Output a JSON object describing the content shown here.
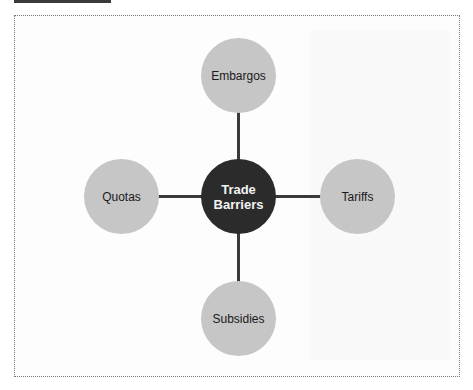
{
  "diagram": {
    "center": {
      "label_line1": "Trade",
      "label_line2": "Barriers"
    },
    "nodes": [
      {
        "position": "top",
        "label": "Embargos"
      },
      {
        "position": "right",
        "label": "Tariffs"
      },
      {
        "position": "bottom",
        "label": "Subsidies"
      },
      {
        "position": "left",
        "label": "Quotas"
      }
    ],
    "colors": {
      "center": "#2b2b2b",
      "node": "#c6c6c6",
      "connector": "#3a3a3a"
    }
  }
}
